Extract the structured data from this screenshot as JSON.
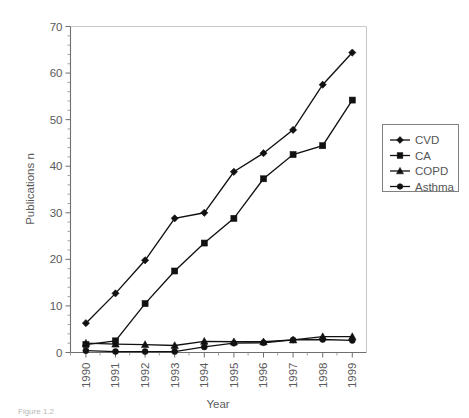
{
  "chart_data": {
    "type": "line",
    "title": "",
    "xlabel": "Year",
    "ylabel": "Publications n",
    "categories": [
      "1990",
      "1991",
      "1992",
      "1993",
      "1994",
      "1995",
      "1996",
      "1997",
      "1998",
      "1999"
    ],
    "ylim": [
      0,
      70
    ],
    "yticks": [
      0,
      10,
      20,
      30,
      40,
      50,
      60,
      70
    ],
    "ytick_labels": [
      "0",
      "10",
      "20",
      "30",
      "40",
      "50",
      "60",
      "70"
    ],
    "minor_ticks": true,
    "grid": false,
    "legend_position": "right",
    "series": [
      {
        "name": "CVD",
        "marker": "diamond",
        "color": "#111111",
        "values": [
          6.3,
          12.7,
          19.8,
          28.8,
          30.0,
          38.8,
          42.8,
          47.8,
          57.5,
          64.4
        ]
      },
      {
        "name": "CA",
        "marker": "square",
        "color": "#111111",
        "values": [
          1.7,
          2.5,
          10.5,
          17.5,
          23.5,
          28.8,
          37.3,
          42.5,
          44.4,
          54.2
        ]
      },
      {
        "name": "COPD",
        "marker": "triangle",
        "color": "#111111",
        "values": [
          2.0,
          1.8,
          1.7,
          1.5,
          2.4,
          2.3,
          2.3,
          2.7,
          3.4,
          3.4
        ]
      },
      {
        "name": "Asthma",
        "marker": "circle",
        "color": "#111111",
        "values": [
          0.4,
          0.2,
          0.2,
          0.2,
          1.2,
          2.0,
          2.1,
          2.7,
          2.8,
          2.6
        ]
      }
    ]
  },
  "caption": {
    "text": "Figure 1.2"
  }
}
